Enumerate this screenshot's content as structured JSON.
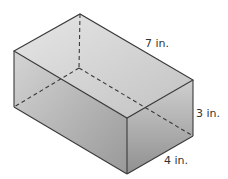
{
  "diagram": {
    "type": "rectangular-prism",
    "dimensions": {
      "length": {
        "label": "7 in.",
        "value": 7,
        "unit": "in."
      },
      "height": {
        "label": "3 in.",
        "value": 3,
        "unit": "in."
      },
      "width": {
        "label": "4 in.",
        "value": 4,
        "unit": "in."
      }
    },
    "colors": {
      "edge": "#3a3a3a",
      "top_face_light": "#e4e4e4",
      "top_face_dark": "#c4c4c4",
      "front_face_light": "#d0d0d0",
      "front_face_dark": "#9a9a9a",
      "side_face_light": "#c8c8c8",
      "side_face_dark": "#8f8f8f"
    }
  }
}
